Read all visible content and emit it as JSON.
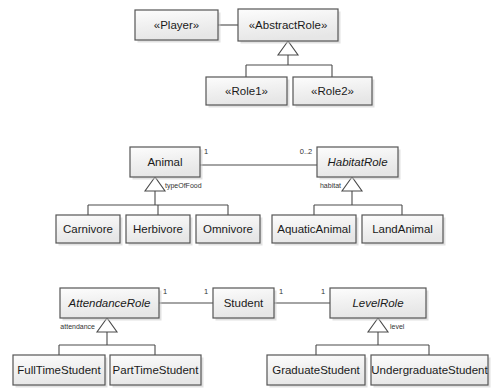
{
  "diagram": {
    "background_color": "#ffffff",
    "box_fill_color": "#f4f4f4",
    "box_border_color": "#555555",
    "line_color": "#4a4a4a",
    "text_color": "#1a1a1a"
  },
  "groups": [
    {
      "id": "player-role-pattern",
      "name": "Player / AbstractRole pattern"
    },
    {
      "id": "animal-pattern",
      "name": "Animal / HabitatRole pattern"
    },
    {
      "id": "student-pattern",
      "name": "Student / AttendanceRole / LevelRole pattern"
    }
  ],
  "classes": [
    {
      "id": "player",
      "label": "«Player»",
      "italic": false,
      "x": 135,
      "y": 10,
      "w": 83,
      "h": 30
    },
    {
      "id": "abstractrole",
      "label": "«AbstractRole»",
      "italic": false,
      "x": 238,
      "y": 9,
      "w": 100,
      "h": 32
    },
    {
      "id": "role1",
      "label": "«Role1»",
      "italic": false,
      "x": 206,
      "y": 77,
      "w": 81,
      "h": 28
    },
    {
      "id": "role2",
      "label": "«Role2»",
      "italic": false,
      "x": 293,
      "y": 77,
      "w": 79,
      "h": 28
    },
    {
      "id": "animal",
      "label": "Animal",
      "italic": false,
      "x": 130,
      "y": 147,
      "w": 70,
      "h": 30
    },
    {
      "id": "habitatrole",
      "label": "HabitatRole",
      "italic": true,
      "x": 317,
      "y": 147,
      "w": 81,
      "h": 30
    },
    {
      "id": "carnivore",
      "label": "Carnivore",
      "italic": false,
      "x": 56,
      "y": 215,
      "w": 64,
      "h": 28
    },
    {
      "id": "herbivore",
      "label": "Herbivore",
      "italic": false,
      "x": 126,
      "y": 215,
      "w": 64,
      "h": 28
    },
    {
      "id": "omnivore",
      "label": "Omnivore",
      "italic": false,
      "x": 196,
      "y": 215,
      "w": 64,
      "h": 28
    },
    {
      "id": "aquaticanimal",
      "label": "AquaticAnimal",
      "italic": false,
      "x": 272,
      "y": 215,
      "w": 84,
      "h": 28
    },
    {
      "id": "landanimal",
      "label": "LandAnimal",
      "italic": false,
      "x": 362,
      "y": 215,
      "w": 81,
      "h": 28
    },
    {
      "id": "attendancerole",
      "label": "AttendanceRole",
      "italic": true,
      "x": 60,
      "y": 288,
      "w": 99,
      "h": 30
    },
    {
      "id": "student",
      "label": "Student",
      "italic": false,
      "x": 213,
      "y": 288,
      "w": 61,
      "h": 30
    },
    {
      "id": "levelrole",
      "label": "LevelRole",
      "italic": true,
      "x": 330,
      "y": 288,
      "w": 96,
      "h": 30
    },
    {
      "id": "fulltimestudent",
      "label": "FullTimeStudent",
      "italic": false,
      "x": 13,
      "y": 355,
      "w": 92,
      "h": 30
    },
    {
      "id": "parttimestudent",
      "label": "PartTimeStudent",
      "italic": false,
      "x": 110,
      "y": 355,
      "w": 91,
      "h": 30
    },
    {
      "id": "graduatestudent",
      "label": "GraduateStudent",
      "italic": false,
      "x": 267,
      "y": 355,
      "w": 98,
      "h": 30
    },
    {
      "id": "undergraduatestudent",
      "label": "UndergraduateStudent",
      "italic": false,
      "x": 371,
      "y": 355,
      "w": 117,
      "h": 30
    }
  ],
  "associations": [
    {
      "id": "player-abstractrole",
      "from": "player",
      "to": "abstractrole",
      "x1": 218,
      "y1": 25,
      "x2": 238,
      "y2": 25,
      "from_mult": "",
      "to_mult": ""
    },
    {
      "id": "animal-habitatrole",
      "from": "animal",
      "to": "habitatrole",
      "x1": 200,
      "y1": 165,
      "x2": 317,
      "y2": 165,
      "from_mult": "1",
      "to_mult": "0..2"
    },
    {
      "id": "attendance-student",
      "from": "attendancerole",
      "to": "student",
      "x1": 159,
      "y1": 303,
      "x2": 213,
      "y2": 303,
      "from_mult": "1",
      "to_mult": "1"
    },
    {
      "id": "student-levelrole",
      "from": "student",
      "to": "levelrole",
      "x1": 274,
      "y1": 303,
      "x2": 330,
      "y2": 303,
      "from_mult": "1",
      "to_mult": "1"
    }
  ],
  "multiplicity_labels": [
    {
      "id": "animal-mult",
      "text": "1",
      "x": 206,
      "y": 152
    },
    {
      "id": "habitatrole-mult",
      "text": "0..2",
      "x": 306,
      "y": 152
    },
    {
      "id": "attendance-mult",
      "text": "1",
      "x": 165,
      "y": 292
    },
    {
      "id": "student-left-mult",
      "text": "1",
      "x": 206,
      "y": 292
    },
    {
      "id": "student-right-mult",
      "text": "1",
      "x": 281,
      "y": 292
    },
    {
      "id": "levelrole-mult",
      "text": "1",
      "x": 323,
      "y": 292
    }
  ],
  "generalizations": [
    {
      "id": "abstractrole-gen",
      "parent": "abstractrole",
      "children": [
        "role1",
        "role2"
      ],
      "role_label": "",
      "apex_x": 288,
      "apex_y": 41,
      "tri_w": 20,
      "tri_h": 14,
      "bar_y": 65,
      "child_tops": [
        {
          "x": 246,
          "y": 77
        },
        {
          "x": 332,
          "y": 77
        }
      ]
    },
    {
      "id": "animal-gen",
      "parent": "animal",
      "children": [
        "carnivore",
        "herbivore",
        "omnivore"
      ],
      "role_label": "typeOfFood",
      "role_label_x": 165,
      "role_label_y": 186,
      "role_label_anchor": "start",
      "apex_x": 155,
      "apex_y": 177,
      "tri_w": 20,
      "tri_h": 14,
      "bar_y": 205,
      "child_tops": [
        {
          "x": 88,
          "y": 215
        },
        {
          "x": 158,
          "y": 215
        },
        {
          "x": 228,
          "y": 215
        }
      ]
    },
    {
      "id": "habitatrole-gen",
      "parent": "habitatrole",
      "children": [
        "aquaticanimal",
        "landanimal"
      ],
      "role_label": "habitat",
      "role_label_x": 341,
      "role_label_y": 186,
      "role_label_anchor": "end",
      "apex_x": 352,
      "apex_y": 177,
      "tri_w": 20,
      "tri_h": 14,
      "bar_y": 205,
      "child_tops": [
        {
          "x": 314,
          "y": 215
        },
        {
          "x": 402,
          "y": 215
        }
      ]
    },
    {
      "id": "attendancerole-gen",
      "parent": "attendancerole",
      "children": [
        "fulltimestudent",
        "parttimestudent"
      ],
      "role_label": "attendance",
      "role_label_x": 95,
      "role_label_y": 327,
      "role_label_anchor": "end",
      "apex_x": 107,
      "apex_y": 318,
      "tri_w": 20,
      "tri_h": 14,
      "bar_y": 345,
      "child_tops": [
        {
          "x": 59,
          "y": 355
        },
        {
          "x": 155,
          "y": 355
        }
      ]
    },
    {
      "id": "levelrole-gen",
      "parent": "levelrole",
      "children": [
        "graduatestudent",
        "undergraduatestudent"
      ],
      "role_label": "level",
      "role_label_x": 390,
      "role_label_y": 327,
      "role_label_anchor": "start",
      "apex_x": 378,
      "apex_y": 318,
      "tri_w": 20,
      "tri_h": 14,
      "bar_y": 345,
      "child_tops": [
        {
          "x": 316,
          "y": 355
        },
        {
          "x": 429,
          "y": 355
        }
      ]
    }
  ]
}
